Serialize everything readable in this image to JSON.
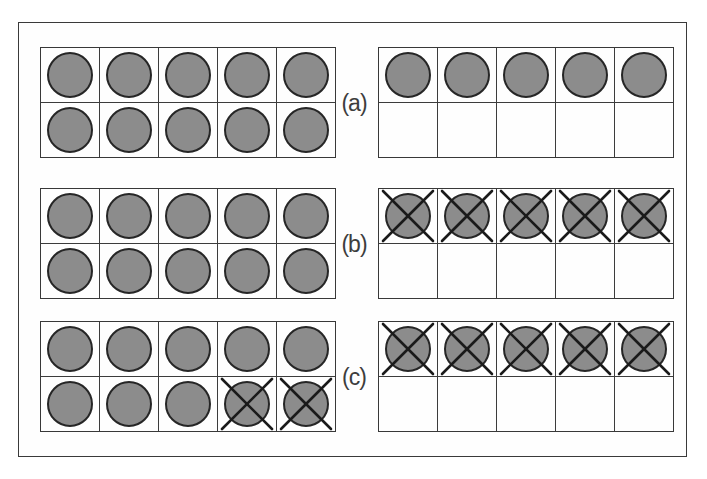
{
  "figure": {
    "colors": {
      "counter_fill": "#8c8c8c",
      "counter_border": "#262626",
      "grid_line": "#3c3c3c",
      "cross": "#1a1a1a",
      "outer_border": "#3a3a3a",
      "background": "#ffffff"
    },
    "rows": [
      {
        "label": "(a)",
        "left_frame": {
          "cells": [
            "filled",
            "filled",
            "filled",
            "filled",
            "filled",
            "filled",
            "filled",
            "filled",
            "filled",
            "filled"
          ]
        },
        "right_frame": {
          "cells": [
            "filled",
            "filled",
            "filled",
            "filled",
            "filled",
            "empty",
            "empty",
            "empty",
            "empty",
            "empty"
          ]
        }
      },
      {
        "label": "(b)",
        "left_frame": {
          "cells": [
            "filled",
            "filled",
            "filled",
            "filled",
            "filled",
            "filled",
            "filled",
            "filled",
            "filled",
            "filled"
          ]
        },
        "right_frame": {
          "cells": [
            "crossed",
            "crossed",
            "crossed",
            "crossed",
            "crossed",
            "empty",
            "empty",
            "empty",
            "empty",
            "empty"
          ]
        }
      },
      {
        "label": "(c)",
        "left_frame": {
          "cells": [
            "filled",
            "filled",
            "filled",
            "filled",
            "filled",
            "filled",
            "filled",
            "filled",
            "crossed",
            "crossed"
          ]
        },
        "right_frame": {
          "cells": [
            "crossed",
            "crossed",
            "crossed",
            "crossed",
            "crossed",
            "empty",
            "empty",
            "empty",
            "empty",
            "empty"
          ]
        }
      }
    ]
  }
}
